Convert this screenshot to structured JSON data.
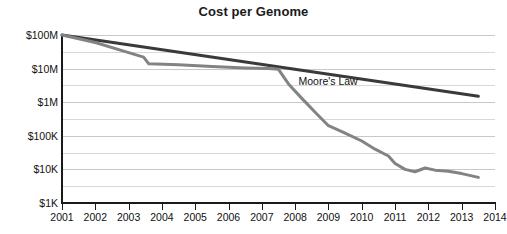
{
  "chart_data": {
    "type": "line",
    "title": "Cost per Genome",
    "xlabel": "",
    "ylabel": "",
    "yscale": "log",
    "ylim": [
      1000,
      100000000
    ],
    "xlim": [
      2001,
      2014
    ],
    "grid": true,
    "legend_position": "inline-annotation",
    "ytick_labels": [
      "$100M",
      "$10M",
      "$1M",
      "$100K",
      "$10K",
      "$1K"
    ],
    "ytick_values": [
      100000000,
      10000000,
      1000000,
      100000,
      10000,
      1000
    ],
    "minor_gridlines": true,
    "xtick_labels": [
      "2001",
      "2002",
      "2003",
      "2004",
      "2005",
      "2006",
      "2007",
      "2008",
      "2009",
      "2010",
      "2011",
      "2012",
      "2013",
      "2014"
    ],
    "xtick_values": [
      2001,
      2002,
      2003,
      2004,
      2005,
      2006,
      2007,
      2008,
      2009,
      2010,
      2011,
      2012,
      2013,
      2014
    ],
    "annotations": [
      {
        "text": "Moore's Law",
        "x": 2008.1,
        "y": 4000000
      }
    ],
    "series": [
      {
        "name": "Moore's Law",
        "color": "#3a3a3a",
        "width": 3,
        "x": [
          2001.0,
          2013.5
        ],
        "values": [
          100000000,
          1500000
        ]
      },
      {
        "name": "Cost per Genome",
        "color": "#838383",
        "width": 3,
        "x": [
          2001.0,
          2002.0,
          2003.0,
          2003.45,
          2003.6,
          2004.5,
          2005.5,
          2006.5,
          2007.2,
          2007.5,
          2007.8,
          2008.2,
          2008.6,
          2009.0,
          2009.5,
          2010.0,
          2010.4,
          2010.8,
          2011.0,
          2011.3,
          2011.6,
          2011.9,
          2012.2,
          2012.6,
          2013.0,
          2013.5
        ],
        "values": [
          100000000,
          60000000,
          30000000,
          22000000,
          14000000,
          13000000,
          11500000,
          10500000,
          10000000,
          9500000,
          3500000,
          1300000,
          500000,
          200000,
          120000,
          70000,
          40000,
          25000,
          15000,
          10000,
          8500,
          11000,
          9500,
          8800,
          7500,
          5800
        ]
      }
    ]
  }
}
